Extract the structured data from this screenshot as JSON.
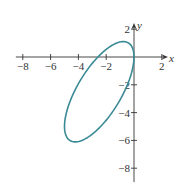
{
  "chart_data": {
    "type": "line",
    "title": "",
    "xlabel": "x",
    "ylabel": "y",
    "xlim": [
      -8.5,
      2.3
    ],
    "ylim": [
      -9,
      2.3
    ],
    "x_ticks": [
      -8,
      -6,
      -4,
      -2,
      2
    ],
    "x_tick_labels": [
      "−8",
      "−6",
      "−4",
      "−2",
      "2"
    ],
    "y_ticks": [
      2,
      -2,
      -4,
      -6,
      -8
    ],
    "y_tick_labels": [
      "2",
      "−2",
      "−4",
      "−6",
      "−8"
    ],
    "grid": false,
    "legend": null,
    "series": [
      {
        "name": "ellipse",
        "color": "#3a8a96",
        "closed": true,
        "points": [
          [
            0,
            0
          ],
          [
            -0.34,
            0.97
          ],
          [
            -1.25,
            1.0
          ],
          [
            -2.5,
            0.1
          ],
          [
            -3.75,
            -1.5
          ],
          [
            -4.67,
            -3.37
          ],
          [
            -5,
            -5
          ],
          [
            -4.67,
            -5.97
          ],
          [
            -3.75,
            -6.0
          ],
          [
            -2.5,
            -5.1
          ],
          [
            -1.25,
            -3.5
          ],
          [
            -0.34,
            -1.64
          ]
        ],
        "parametric": {
          "x": "-2.5 + 2.5*cos(t)",
          "y": "-2.5 + 2.5*cos(t) + 2.6*sin(t)"
        }
      }
    ]
  },
  "layout": {
    "origin_px": [
      134,
      57
    ],
    "unit_px": 13.9,
    "axis_color": "#333333"
  }
}
